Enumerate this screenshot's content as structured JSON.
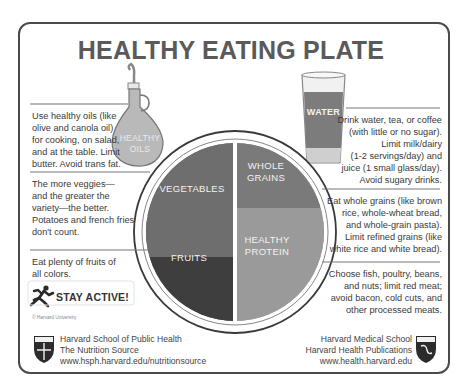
{
  "title": "HEALTHY EATING PLATE",
  "icons": {
    "oil_bottle": {
      "label_line1": "HEALTHY",
      "label_line2": "OILS"
    },
    "water_glass": {
      "label": "WATER"
    }
  },
  "plate": {
    "sections": [
      {
        "name": "vegetables",
        "label": "VEGETABLES",
        "shade": "#6e6e6e"
      },
      {
        "name": "whole-grains",
        "label_line1": "WHOLE",
        "label_line2": "GRAINS",
        "shade": "#7a7a7a"
      },
      {
        "name": "fruits",
        "label": "FRUITS",
        "shade": "#3e3e3e"
      },
      {
        "name": "healthy-protein",
        "label_line1": "HEALTHY",
        "label_line2": "PROTEIN",
        "shade": "#9a9a9a"
      }
    ]
  },
  "left_notes": {
    "oils": [
      "Use healthy oils (like",
      "olive and canola oil)",
      "for cooking, on salad,",
      "and at the table. Limit",
      "butter. Avoid trans fat."
    ],
    "vegetables": [
      "The more veggies—",
      "and the greater the",
      "variety—the better.",
      "Potatoes and french fries",
      "don't count."
    ],
    "fruits": [
      "Eat plenty of fruits of",
      "all colors."
    ]
  },
  "right_notes": {
    "water": [
      "Drink water, tea, or coffee",
      "(with little or no sugar).",
      "Limit milk/dairy",
      "(1-2 servings/day) and",
      "juice (1 small glass/day).",
      "Avoid sugary drinks."
    ],
    "grains": [
      "Eat whole grains (like brown",
      "rice, whole-wheat bread,",
      "and whole-grain pasta).",
      "Limit refined grains (like",
      "white rice and white bread)."
    ],
    "protein": [
      "Choose fish, poultry, beans,",
      "and nuts; limit red meat;",
      "avoid bacon, cold cuts, and",
      "other processed meats."
    ]
  },
  "stay_active": "STAY ACTIVE!",
  "copyright": "© Harvard University",
  "footer_left": [
    "Harvard School of Public Health",
    "The Nutrition Source",
    "www.hsph.harvard.edu/nutritionsource"
  ],
  "footer_right": [
    "Harvard Medical School",
    "Harvard Health Publications",
    "www.health.harvard.edu"
  ]
}
